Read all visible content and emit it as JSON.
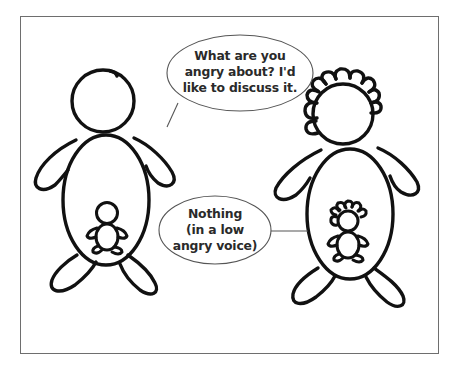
{
  "comic": {
    "panel_count": 1,
    "left_character": {
      "role": "parent",
      "hair": "none",
      "has_inner_child": true
    },
    "right_character": {
      "role": "parent",
      "hair": "curly",
      "has_inner_child": true,
      "inner_child_hair": "curly"
    },
    "speech_bubbles": [
      {
        "speaker": "left_character",
        "lines": [
          "What are you",
          "angry about? I'd",
          "like to discuss it."
        ]
      },
      {
        "speaker": "right_character",
        "lines": [
          "Nothing",
          "(in a low",
          "angry voice)"
        ]
      }
    ],
    "colors": {
      "ink": "#111111",
      "bubble_outline": "#555555",
      "frame": "#6e6e6e",
      "background": "#ffffff"
    }
  }
}
